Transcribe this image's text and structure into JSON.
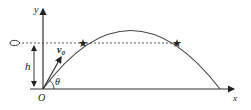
{
  "diagram": {
    "type": "projectile-motion",
    "labels": {
      "y_axis": "y",
      "x_axis": "x",
      "origin": "O",
      "height": "h",
      "velocity": "v",
      "velocity_sub": "0",
      "angle": "θ"
    },
    "colors": {
      "stroke": "#333333",
      "background": "#ffffff"
    }
  }
}
